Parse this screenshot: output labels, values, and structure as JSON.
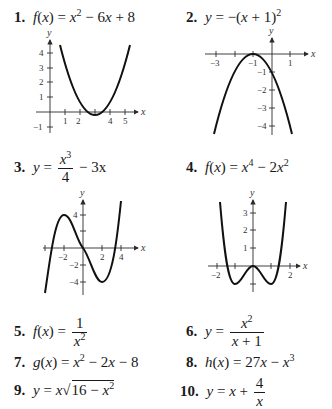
{
  "problems": [
    {
      "number": "1.",
      "lhs": "f(x)",
      "rhs": "x² − 6x + 8"
    },
    {
      "number": "2.",
      "lhs": "y",
      "rhs": "−(x + 1)²"
    },
    {
      "number": "3.",
      "lhs": "y",
      "rhs": "x³/4 − 3x",
      "numerator": "x³",
      "denominator": "4",
      "tail": "− 3x"
    },
    {
      "number": "4.",
      "lhs": "f(x)",
      "rhs": "x⁴ − 2x²"
    },
    {
      "number": "5.",
      "lhs": "f(x)",
      "rhs": "1/x²",
      "numerator": "1",
      "denominator": "x²"
    },
    {
      "number": "6.",
      "lhs": "y",
      "rhs": "x²/(x + 1)",
      "numerator": "x²",
      "denominator": "x + 1"
    },
    {
      "number": "7.",
      "lhs": "g(x)",
      "rhs": "x² − 2x − 8"
    },
    {
      "number": "8.",
      "lhs": "h(x)",
      "rhs": "27x − x³"
    },
    {
      "number": "9.",
      "lhs": "y",
      "rhs": "x√(16 − x²)"
    },
    {
      "number": "10.",
      "lhs": "y",
      "rhs": "x + 4/x",
      "numerator": "4",
      "denominator": "x"
    }
  ],
  "graphs": [
    {
      "id": 1,
      "x_axis_label": "x",
      "y_axis_label": "y",
      "x_ticks": [
        "1",
        "2",
        "4",
        "5"
      ],
      "y_ticks": [
        "4",
        "3",
        "2",
        "1",
        "−1"
      ]
    },
    {
      "id": 2,
      "x_axis_label": "x",
      "y_axis_label": "y",
      "x_ticks": [
        "−3",
        "−1",
        "1"
      ],
      "y_ticks": [
        "−1",
        "−2",
        "−3",
        "−4"
      ]
    },
    {
      "id": 3,
      "x_axis_label": "x",
      "y_axis_label": "y",
      "x_ticks": [
        "−2",
        "2",
        "4"
      ],
      "y_ticks": [
        "4",
        "−2",
        "−4"
      ]
    },
    {
      "id": 4,
      "x_axis_label": "x",
      "y_axis_label": "y",
      "x_ticks": [
        "−2",
        "2"
      ],
      "y_ticks": [
        "3",
        "2",
        "1"
      ]
    }
  ]
}
